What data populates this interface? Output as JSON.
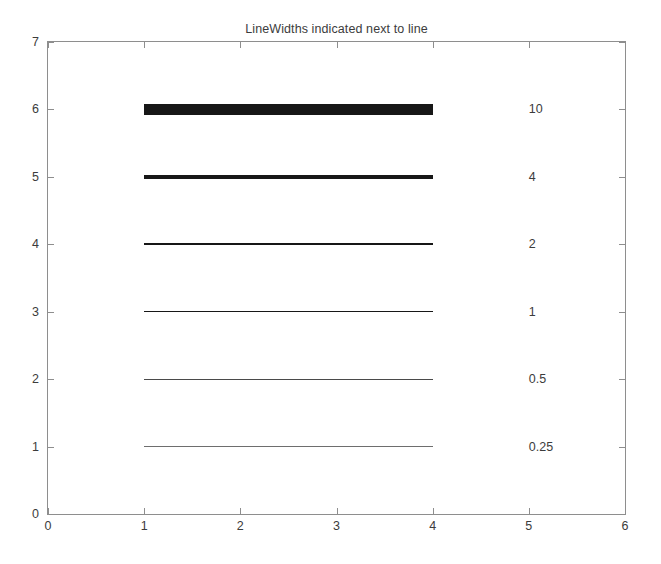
{
  "chart_data": {
    "type": "line",
    "title": "LineWidths indicated next to line",
    "xlabel": "",
    "ylabel": "",
    "xlim": [
      0,
      6
    ],
    "ylim": [
      0,
      7
    ],
    "xticks": [
      "0",
      "1",
      "2",
      "3",
      "4",
      "5",
      "6"
    ],
    "yticks": [
      "0",
      "1",
      "2",
      "3",
      "4",
      "5",
      "6",
      "7"
    ],
    "grid": false,
    "legend": "none",
    "x_segment": [
      1,
      4
    ],
    "series": [
      {
        "name": "linewidth-10",
        "y": 6,
        "x": [
          1,
          4
        ],
        "linewidth": 10,
        "label": "10",
        "label_x": 5,
        "color": "#171717"
      },
      {
        "name": "linewidth-4",
        "y": 5,
        "x": [
          1,
          4
        ],
        "linewidth": 4,
        "label": "4",
        "label_x": 5,
        "color": "#171717"
      },
      {
        "name": "linewidth-2",
        "y": 4,
        "x": [
          1,
          4
        ],
        "linewidth": 2,
        "label": "2",
        "label_x": 5,
        "color": "#171717"
      },
      {
        "name": "linewidth-1",
        "y": 3,
        "x": [
          1,
          4
        ],
        "linewidth": 1,
        "label": "1",
        "label_x": 5,
        "color": "#171717"
      },
      {
        "name": "linewidth-0.5",
        "y": 2,
        "x": [
          1,
          4
        ],
        "linewidth": 0.5,
        "label": "0.5",
        "label_x": 5,
        "color": "#4a4a4a"
      },
      {
        "name": "linewidth-0.25",
        "y": 1,
        "x": [
          1,
          4
        ],
        "linewidth": 0.25,
        "label": "0.25",
        "label_x": 5,
        "color": "#6e6e6e"
      }
    ],
    "axis_color": "#8e8e8e",
    "background_color": "#ffffff",
    "text_color": "#3c3c3c"
  }
}
